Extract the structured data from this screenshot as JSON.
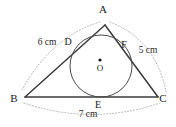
{
  "figure": {
    "type": "geometry-diagram",
    "background_color": "#ffffff",
    "stroke_color": "#3b3b3b",
    "circle_color": "#4a4a4a",
    "arc_color": "#a8a8a8",
    "vertices": [
      {
        "id": "A",
        "label": "A",
        "x": 105,
        "y": 25,
        "label_x": 103,
        "label_y": 13
      },
      {
        "id": "B",
        "label": "B",
        "x": 25,
        "y": 97,
        "label_x": 14,
        "label_y": 102
      },
      {
        "id": "C",
        "label": "C",
        "x": 158,
        "y": 97,
        "label_x": 163,
        "label_y": 102
      }
    ],
    "tangent_points": [
      {
        "id": "D",
        "label": "D",
        "x": 79,
        "y": 47,
        "label_x": 68,
        "label_y": 45,
        "on_side": "AB"
      },
      {
        "id": "E",
        "label": "E",
        "x": 101,
        "y": 97,
        "label_x": 98,
        "label_y": 108,
        "on_side": "BC"
      },
      {
        "id": "F",
        "label": "F",
        "x": 129,
        "y": 50,
        "label_x": 124,
        "label_y": 48,
        "on_side": "AC"
      }
    ],
    "center": {
      "id": "O",
      "label": "O",
      "x": 100,
      "y": 60,
      "label_x": 100,
      "label_y": 71,
      "dot_radius": 1.6
    },
    "incircle": {
      "cx": 101,
      "cy": 66,
      "r": 31
    },
    "side_measures": [
      {
        "side": "AB",
        "label": "6 cm",
        "label_x": 47,
        "label_y": 45
      },
      {
        "side": "AC",
        "label": "5 cm",
        "label_x": 148,
        "label_y": 53
      },
      {
        "side": "BC",
        "label": "7 cm",
        "label_x": 88,
        "label_y": 117
      }
    ]
  }
}
